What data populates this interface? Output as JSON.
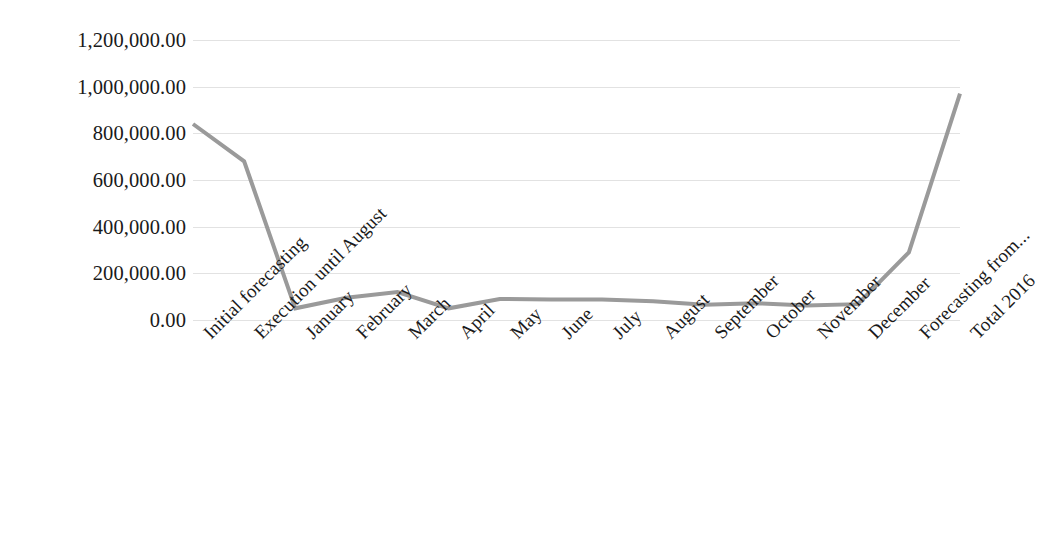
{
  "chart_data": {
    "type": "line",
    "title": "",
    "subtitle": "",
    "xlabel": "",
    "ylabel": "",
    "categories": [
      "Initial forecasting",
      "Execution until August",
      "January",
      "February",
      "March",
      "April",
      "May",
      "June",
      "July",
      "August",
      "September",
      "October",
      "November",
      "December",
      "Forecasting from...",
      "Total 2016"
    ],
    "values": [
      840000,
      680000,
      50000,
      95000,
      120000,
      50000,
      90000,
      88000,
      88000,
      80000,
      65000,
      72000,
      62000,
      68000,
      290000,
      970000
    ],
    "series": [
      {
        "name": "Amount",
        "values": [
          840000,
          680000,
          50000,
          95000,
          120000,
          50000,
          90000,
          88000,
          88000,
          80000,
          65000,
          72000,
          62000,
          68000,
          290000,
          970000
        ],
        "color": "#9a9a9a"
      }
    ],
    "ylim": [
      0,
      1200000
    ],
    "ytick_values": [
      0,
      200000,
      400000,
      600000,
      800000,
      1000000,
      1200000
    ],
    "ytick_labels": [
      "0.00",
      "200,000.00",
      "400,000.00",
      "600,000.00",
      "800,000.00",
      "1,000,000.00",
      "1,200,000.00"
    ],
    "grid": "horizontal",
    "grid_color": "#e2e2e2",
    "legend": "none",
    "markers": "none",
    "line_width": 4,
    "x_label_rotation": -45,
    "background_color": "#ffffff",
    "text_color": "#1a1a1a"
  }
}
